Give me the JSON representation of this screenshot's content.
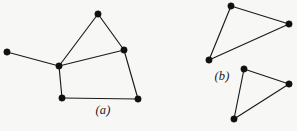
{
  "figure": {
    "width": 297,
    "height": 131,
    "background_color": "#f7f7f6",
    "ink_color": "#111111",
    "edge_color": "#1a1a1a"
  },
  "panels": [
    {
      "id": "panel-a",
      "caption": "(a)",
      "caption_x": 103,
      "caption_y": 110
    },
    {
      "id": "panel-b",
      "caption": "(b)",
      "caption_x": 222,
      "caption_y": 76
    }
  ],
  "chart_data": {
    "type": "graph-diagram",
    "title": "",
    "graphs": [
      {
        "name": "graph-a",
        "panel": "panel-a",
        "caption": "(a)",
        "vertex_count": 6,
        "edge_count": 7,
        "vertices": [
          {
            "id": "a1",
            "label": "left-pendant",
            "x": 7,
            "y": 52
          },
          {
            "id": "a2",
            "label": "hub",
            "x": 59,
            "y": 66
          },
          {
            "id": "a3",
            "label": "apex",
            "x": 98,
            "y": 14
          },
          {
            "id": "a4",
            "label": "right-upper",
            "x": 124,
            "y": 50
          },
          {
            "id": "a5",
            "label": "bottom-left",
            "x": 62,
            "y": 98
          },
          {
            "id": "a6",
            "label": "bottom-right",
            "x": 138,
            "y": 99
          }
        ],
        "edges": [
          {
            "from": "a1",
            "to": "a2"
          },
          {
            "from": "a2",
            "to": "a3"
          },
          {
            "from": "a3",
            "to": "a4"
          },
          {
            "from": "a2",
            "to": "a4"
          },
          {
            "from": "a2",
            "to": "a5"
          },
          {
            "from": "a5",
            "to": "a6"
          },
          {
            "from": "a4",
            "to": "a6"
          }
        ]
      },
      {
        "name": "graph-b-upper-triangle",
        "panel": "panel-b",
        "caption": "(b)",
        "vertex_count": 3,
        "edge_count": 3,
        "vertices": [
          {
            "id": "b1",
            "label": "top",
            "x": 231,
            "y": 6
          },
          {
            "id": "b2",
            "label": "right",
            "x": 289,
            "y": 24
          },
          {
            "id": "b3",
            "label": "lower-left",
            "x": 209,
            "y": 60
          }
        ],
        "edges": [
          {
            "from": "b1",
            "to": "b2"
          },
          {
            "from": "b2",
            "to": "b3"
          },
          {
            "from": "b3",
            "to": "b1"
          }
        ]
      },
      {
        "name": "graph-b-lower-triangle",
        "panel": "panel-b",
        "caption": "(b)",
        "vertex_count": 3,
        "edge_count": 3,
        "vertices": [
          {
            "id": "b4",
            "label": "top",
            "x": 244,
            "y": 69
          },
          {
            "id": "b5",
            "label": "right",
            "x": 289,
            "y": 84
          },
          {
            "id": "b6",
            "label": "bottom",
            "x": 234,
            "y": 119
          }
        ],
        "edges": [
          {
            "from": "b4",
            "to": "b5"
          },
          {
            "from": "b5",
            "to": "b6"
          },
          {
            "from": "b6",
            "to": "b4"
          }
        ]
      }
    ],
    "vertex_radius": 3.2,
    "edge_width": 1.15
  }
}
